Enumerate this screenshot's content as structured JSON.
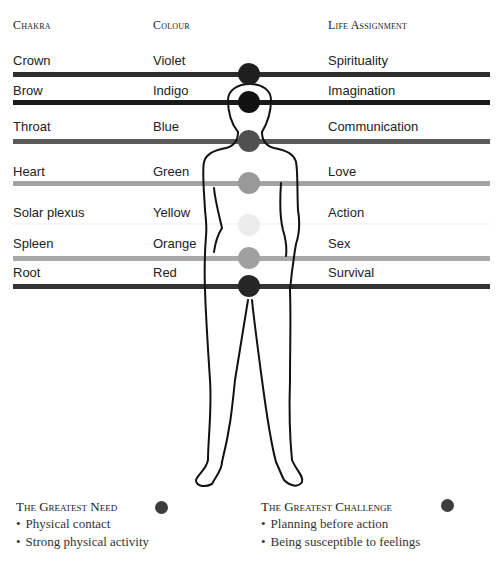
{
  "headers": {
    "chakra": "Chakra",
    "colour": "Colour",
    "life_assignment": "Life Assignment"
  },
  "rows": [
    {
      "chakra": "Crown",
      "colour": "Violet",
      "life": "Spirituality",
      "line_color": "#2e2e2e",
      "dot_color": "#1f1f1f"
    },
    {
      "chakra": "Brow",
      "colour": "Indigo",
      "life": "Imagination",
      "line_color": "#1a1a1a",
      "dot_color": "#111111"
    },
    {
      "chakra": "Throat",
      "colour": "Blue",
      "life": "Communication",
      "line_color": "#5a5a5a",
      "dot_color": "#505050"
    },
    {
      "chakra": "Heart",
      "colour": "Green",
      "life": "Love",
      "line_color": "#a3a3a3",
      "dot_color": "#999999"
    },
    {
      "chakra": "Solar plexus",
      "colour": "Yellow",
      "life": "Action",
      "line_color": "#f4f4f4",
      "dot_color": "#ececec"
    },
    {
      "chakra": "Spleen",
      "colour": "Orange",
      "life": "Sex",
      "line_color": "#a8a8a8",
      "dot_color": "#a0a0a0"
    },
    {
      "chakra": "Root",
      "colour": "Red",
      "life": "Survival",
      "line_color": "#333333",
      "dot_color": "#262626"
    }
  ],
  "greatest_need": {
    "title": "The Greatest Need",
    "dot_color": "#3d3d3d",
    "items": [
      "Physical contact",
      "Strong physical activity"
    ]
  },
  "greatest_challenge": {
    "title": "The Greatest Challenge",
    "dot_color": "#3d3d3d",
    "items": [
      "Planning before action",
      "Being susceptible to feelings"
    ]
  }
}
